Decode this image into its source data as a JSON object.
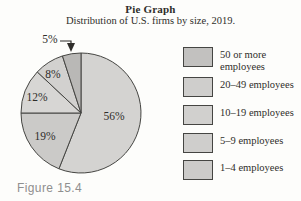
{
  "header": {
    "title": "Pie Graph",
    "subtitle": "Distribution of U.S. firms by size, 2019."
  },
  "figure_label": "Figure 15.4",
  "colors": {
    "background": "#fdfdfb",
    "outline": "#454542",
    "text": "#2f2d2a",
    "figure_label": "#8f8f8f"
  },
  "chart_data": {
    "type": "pie",
    "title": "Pie Graph",
    "subtitle": "Distribution of U.S. firms by size, 2019.",
    "direction": "clockwise",
    "start_angle_deg": 0,
    "legend_position": "right",
    "slices": [
      {
        "category": "1–4 employees",
        "label": "56%",
        "value": 56,
        "color": "#d4d3d1"
      },
      {
        "category": "5–9 employees",
        "label": "19%",
        "value": 19,
        "color": "#cbcac8"
      },
      {
        "category": "10–19 employees",
        "label": "12%",
        "value": 12,
        "color": "#d7d6d4"
      },
      {
        "category": "20–49 employees",
        "label": "8%",
        "value": 8,
        "color": "#d2d1cf"
      },
      {
        "category": "50 or more employees",
        "label": "5%",
        "value": 5,
        "color": "#b9b8b6"
      }
    ],
    "callout": {
      "label": "5%",
      "points_to": "50 or more employees slice"
    }
  },
  "legend": {
    "items": [
      {
        "label": "50 or more employees",
        "swatch_color": "#c2c1bf"
      },
      {
        "label": "20–49 employees",
        "swatch_color": "#cfcecc"
      },
      {
        "label": "10–19 employees",
        "swatch_color": "#d1d0ce"
      },
      {
        "label": "5–9 employees",
        "swatch_color": "#cfcecc"
      },
      {
        "label": "1–4 employees",
        "swatch_color": "#cccbc9"
      }
    ]
  }
}
